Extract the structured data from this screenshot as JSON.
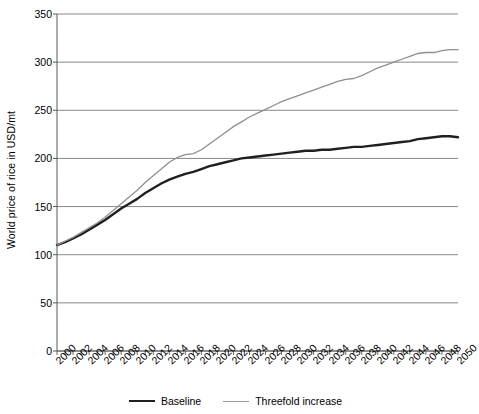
{
  "chart_data": {
    "type": "line",
    "title": "",
    "xlabel": "",
    "ylabel": "World price of rice in USD/mt",
    "xlim": [
      2000,
      2050
    ],
    "ylim": [
      0,
      350
    ],
    "yticks": [
      0,
      50,
      100,
      150,
      200,
      250,
      300,
      350
    ],
    "ytick_labels": [
      "0",
      "50",
      "100",
      "150",
      "200",
      "250",
      "300",
      "350"
    ],
    "grid": true,
    "legend_position": "bottom",
    "x": [
      2000,
      2001,
      2002,
      2003,
      2004,
      2005,
      2006,
      2007,
      2008,
      2009,
      2010,
      2011,
      2012,
      2013,
      2014,
      2015,
      2016,
      2017,
      2018,
      2019,
      2020,
      2021,
      2022,
      2023,
      2024,
      2025,
      2026,
      2027,
      2028,
      2029,
      2030,
      2031,
      2032,
      2033,
      2034,
      2035,
      2036,
      2037,
      2038,
      2039,
      2040,
      2041,
      2042,
      2043,
      2044,
      2045,
      2046,
      2047,
      2048,
      2049,
      2050
    ],
    "xtick_labels": [
      "2000",
      "2002",
      "2004",
      "2006",
      "2008",
      "2010",
      "2012",
      "2014",
      "2016",
      "2018",
      "2020",
      "2022",
      "2024",
      "2026",
      "2028",
      "2030",
      "2032",
      "2034",
      "2036",
      "2038",
      "2040",
      "2042",
      "2044",
      "2046",
      "2048",
      "2050"
    ],
    "series": [
      {
        "name": "Baseline",
        "color": "#231f20",
        "width": 2.4,
        "values": [
          110,
          113,
          117,
          121,
          126,
          131,
          136,
          142,
          148,
          153,
          158,
          164,
          169,
          174,
          178,
          181,
          184,
          186,
          189,
          192,
          194,
          196,
          198,
          200,
          201,
          202,
          203,
          204,
          205,
          206,
          207,
          208,
          208,
          209,
          209,
          210,
          211,
          212,
          212,
          213,
          214,
          215,
          216,
          217,
          218,
          220,
          221,
          222,
          223,
          223,
          222
        ]
      },
      {
        "name": "Threefold increase",
        "color": "#8f8f8f",
        "width": 1.3,
        "values": [
          110,
          114,
          118,
          123,
          128,
          133,
          139,
          146,
          153,
          160,
          167,
          175,
          182,
          189,
          196,
          201,
          204,
          205,
          209,
          215,
          221,
          227,
          233,
          238,
          243,
          247,
          251,
          255,
          259,
          262,
          265,
          268,
          271,
          274,
          277,
          280,
          282,
          283,
          286,
          290,
          294,
          297,
          300,
          303,
          306,
          309,
          310,
          310,
          312,
          313,
          313
        ]
      }
    ]
  },
  "legend": {
    "items": [
      {
        "label": "Baseline"
      },
      {
        "label": "Threefold increase"
      }
    ]
  }
}
